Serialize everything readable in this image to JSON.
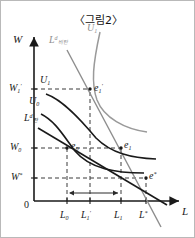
{
  "figure": {
    "title": "〈그림2〉",
    "axes": {
      "y_axis_label": "W",
      "x_axis_label": "L",
      "origin_label": "0"
    },
    "y_ticks": [
      {
        "id": "w1p",
        "base": "W",
        "sub": "1",
        "prime": "′",
        "y_px": 88
      },
      {
        "id": "w0",
        "base": "W",
        "sub": "0",
        "prime": "",
        "y_px": 147
      },
      {
        "id": "wstar",
        "base": "W",
        "sub": "",
        "prime": "*",
        "y_px": 177
      }
    ],
    "x_ticks": [
      {
        "id": "l0",
        "base": "L",
        "sub": "0",
        "prime": "",
        "x_px": 66
      },
      {
        "id": "l1p",
        "base": "L",
        "sub": "1",
        "prime": "′",
        "x_px": 89
      },
      {
        "id": "l1",
        "base": "L",
        "sub": "1",
        "prime": "",
        "x_px": 120
      },
      {
        "id": "lstar",
        "base": "L",
        "sub": "",
        "prime": "*",
        "x_px": 145
      }
    ],
    "curves": [
      {
        "id": "u1_prime",
        "label_base": "U",
        "label_sub": "1",
        "label_prime": "′",
        "color": "#9a9a9a",
        "kind": "indifference-curve"
      },
      {
        "id": "ld_inelastic",
        "label_base": "L",
        "label_sup": "d",
        "label_sub_ko": "비탄",
        "color": "#8d8d8d",
        "kind": "labor-demand-inelastic"
      },
      {
        "id": "u1",
        "label_base": "U",
        "label_sub": "1",
        "label_prime": "",
        "color": "#1a1a1a",
        "kind": "indifference-curve"
      },
      {
        "id": "u0",
        "label_base": "U",
        "label_sub": "0",
        "label_prime": "",
        "color": "#1a1a1a",
        "kind": "indifference-curve"
      },
      {
        "id": "ld_elastic",
        "label_base": "L",
        "label_sup": "d",
        "label_sub_ko": "탄",
        "color": "#1a1a1a",
        "kind": "labor-demand-elastic"
      }
    ],
    "points": [
      {
        "id": "e1_prime",
        "base": "e",
        "sub": "1",
        "prime": "′",
        "x_px": 89,
        "y_px": 88
      },
      {
        "id": "e0",
        "base": "e",
        "sub": "0",
        "prime": "",
        "x_px": 66,
        "y_px": 147
      },
      {
        "id": "e1",
        "base": "e",
        "sub": "1",
        "prime": "",
        "x_px": 120,
        "y_px": 147
      },
      {
        "id": "e_star",
        "base": "e",
        "sub": "",
        "prime": "*",
        "x_px": 145,
        "y_px": 177
      }
    ],
    "annotation": {
      "span_arrow": "double-headed arrow from L0 to L1"
    },
    "colors": {
      "ink": "#1a1a1a",
      "gray": "#8d8d8d",
      "light_gray": "#9a9a9a",
      "dashed": "#3a3a3a",
      "border": "#b9b9b9",
      "background": "#ffffff"
    }
  }
}
